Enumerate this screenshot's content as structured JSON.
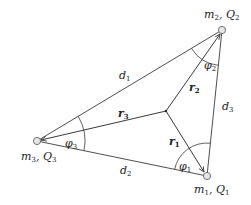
{
  "colors": {
    "line": "#3a3a3a",
    "node_fill": "#e6e6e6",
    "node_stroke": "#555555",
    "text": "#222222",
    "background": "#ffffff"
  },
  "nodes": [
    {
      "id": "m1",
      "label_main": "m",
      "label_sub": "1",
      "label_q": "Q",
      "label_qsub": "1",
      "x": 207,
      "y": 176
    },
    {
      "id": "m2",
      "label_main": "m",
      "label_sub": "2",
      "label_q": "Q",
      "label_qsub": "2",
      "x": 222,
      "y": 30
    },
    {
      "id": "m3",
      "label_main": "m",
      "label_sub": "3",
      "label_q": "Q",
      "label_qsub": "3",
      "x": 37,
      "y": 141
    }
  ],
  "center": {
    "x": 166,
    "y": 111
  },
  "edges": {
    "d1": {
      "main": "d",
      "sub": "1"
    },
    "d2": {
      "main": "d",
      "sub": "2"
    },
    "d3": {
      "main": "d",
      "sub": "3"
    }
  },
  "vectors": {
    "r1": {
      "main": "r",
      "sub": "1"
    },
    "r2": {
      "main": "r",
      "sub": "2"
    },
    "r3": {
      "main": "r",
      "sub": "3"
    }
  },
  "angles": {
    "phi1": {
      "main": "φ",
      "sub": "1"
    },
    "phi2": {
      "main": "φ",
      "sub": "2"
    },
    "phi3": {
      "main": "φ",
      "sub": "3"
    }
  }
}
